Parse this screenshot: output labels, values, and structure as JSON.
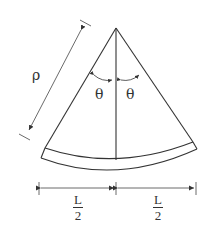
{
  "diagram": {
    "labels": {
      "radius": "ρ",
      "angle_left": "θ",
      "angle_right": "θ",
      "half_length_left": {
        "numerator": "L",
        "denominator": "2"
      },
      "half_length_right": {
        "numerator": "L",
        "denominator": "2"
      }
    },
    "colors": {
      "stroke": "#333333",
      "dimension": "#444444",
      "background": "#ffffff"
    }
  }
}
